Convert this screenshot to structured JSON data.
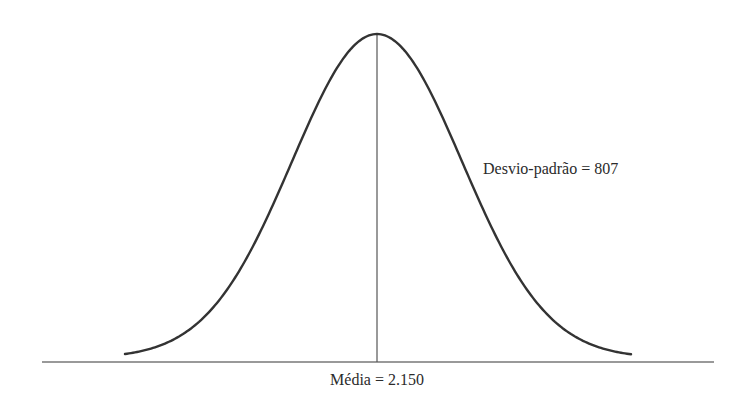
{
  "chart_data": {
    "type": "line",
    "subtype": "normal-distribution-curve",
    "title": "",
    "xlabel": "",
    "ylabel": "",
    "grid": false,
    "legend": null,
    "mean": 2150,
    "std_dev": 807,
    "annotations": [
      {
        "id": "std_dev",
        "text": "Desvio-padrão = 807"
      },
      {
        "id": "mean",
        "text": "Média = 2.150"
      }
    ],
    "elements": {
      "baseline": true,
      "mean_vertical_line": true
    },
    "colors": {
      "curve": "#333333",
      "axis": "#777777",
      "mean_line": "#555555",
      "text": "#2b2b2b"
    }
  },
  "labels": {
    "std_dev": "Desvio-padrão = 807",
    "mean": "Média = 2.150"
  }
}
